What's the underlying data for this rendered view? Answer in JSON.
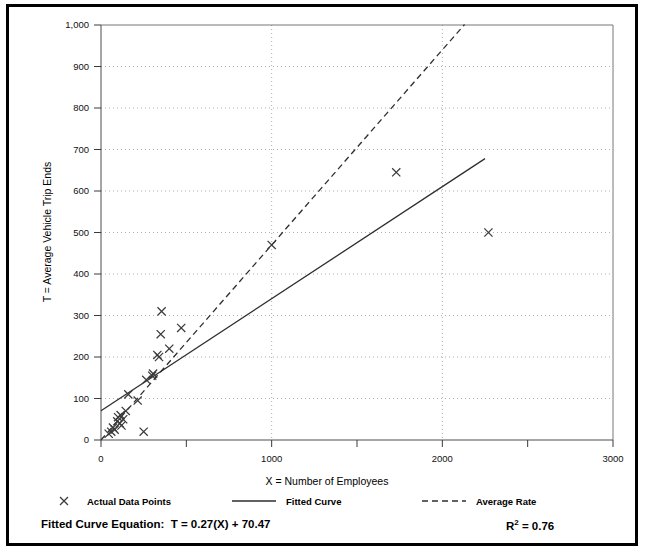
{
  "figure": {
    "x_axis_title": "X = Number of Employees",
    "y_axis_title": "T = Average Vehicle Trip Ends"
  },
  "legend": {
    "items": [
      {
        "label": "Actual Data Points",
        "glyph": "x-marker-icon"
      },
      {
        "label": "Fitted Curve",
        "glyph": "solid-line-icon"
      },
      {
        "label": "Average Rate",
        "glyph": "dashed-line-icon"
      }
    ]
  },
  "equation": {
    "label": "Fitted Curve Equation:",
    "formula": "T = 0.27(X) + 70.47",
    "r_squared_prefix": "R",
    "r_squared_exponent": "2",
    "r_squared_value": " = 0.76"
  },
  "chart_data": {
    "type": "scatter",
    "title": "",
    "xlabel": "X = Number of Employees",
    "ylabel": "T = Average Vehicle Trip Ends",
    "xlim": [
      0,
      3000
    ],
    "ylim": [
      0,
      1000
    ],
    "xticks": [
      0,
      1000,
      2000,
      3000
    ],
    "xtick_labels": [
      "0",
      "1000",
      "2000",
      "3000"
    ],
    "xminor_ticks": [
      500,
      1500,
      2500
    ],
    "yticks": [
      0,
      100,
      200,
      300,
      400,
      500,
      600,
      700,
      800,
      900,
      1000
    ],
    "ytick_labels": [
      "0",
      "100",
      "200",
      "300",
      "400",
      "500",
      "600",
      "700",
      "800",
      "900",
      "1,000"
    ],
    "grid": {
      "horizontal": true,
      "vertical": true,
      "style": "dotted"
    },
    "legend_position": "below-plot",
    "series": [
      {
        "name": "Actual Data Points",
        "type": "scatter",
        "marker": "x",
        "color": "#3b3b3b",
        "points": [
          [
            45,
            15
          ],
          [
            60,
            20
          ],
          [
            70,
            30
          ],
          [
            80,
            25
          ],
          [
            95,
            45
          ],
          [
            100,
            55
          ],
          [
            110,
            40
          ],
          [
            115,
            60
          ],
          [
            120,
            35
          ],
          [
            130,
            50
          ],
          [
            145,
            70
          ],
          [
            160,
            110
          ],
          [
            215,
            95
          ],
          [
            250,
            20
          ],
          [
            265,
            145
          ],
          [
            300,
            155
          ],
          [
            305,
            160
          ],
          [
            330,
            205
          ],
          [
            340,
            200
          ],
          [
            350,
            255
          ],
          [
            355,
            310
          ],
          [
            400,
            220
          ],
          [
            470,
            270
          ],
          [
            1000,
            470
          ],
          [
            1730,
            645
          ],
          [
            2270,
            500
          ]
        ]
      },
      {
        "name": "Fitted Curve",
        "type": "line",
        "style": "solid",
        "color": "#2e2e2e",
        "equation": "T = 0.27(X) + 70.47",
        "slope": 0.27,
        "intercept": 70.47,
        "r_squared": 0.76,
        "x_range": [
          0,
          2250
        ]
      },
      {
        "name": "Average Rate",
        "type": "line",
        "style": "dashed",
        "color": "#2e2e2e",
        "slope": 0.47,
        "intercept": 0,
        "x_range": [
          0,
          2130
        ]
      }
    ]
  }
}
